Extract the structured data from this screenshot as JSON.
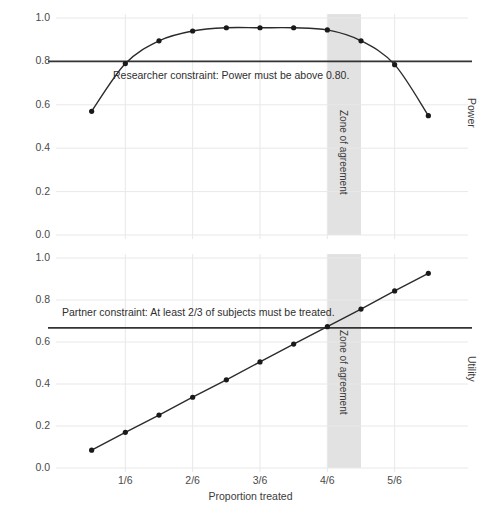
{
  "figure": {
    "width": 501,
    "height": 519,
    "background": "#ffffff",
    "grid_color": "#e8e8e8",
    "line_color": "#2b2b2b",
    "marker_color": "#1a1a1a",
    "band_color": "#e2e2e2"
  },
  "xaxis": {
    "label": "Proportion treated",
    "ticks": [
      "1/6",
      "2/6",
      "3/6",
      "4/6",
      "5/6"
    ],
    "tick_values": [
      0.16667,
      0.33333,
      0.5,
      0.66667,
      0.83333
    ],
    "range": [
      0.0,
      1.0
    ]
  },
  "panels": {
    "power": {
      "axis_title": "Power",
      "yticks": [
        "0.0",
        "0.2",
        "0.4",
        "0.6",
        "0.8",
        "1.0"
      ],
      "ytick_values": [
        0.0,
        0.2,
        0.4,
        0.6,
        0.8,
        1.0
      ],
      "ylim": [
        0.0,
        1.0
      ],
      "constraint_value": 0.8,
      "constraint_text": "Researcher constraint: Power must be above 0.80.",
      "zone_label": "Zone of agreement"
    },
    "utility": {
      "axis_title": "Utility",
      "yticks": [
        "0.0",
        "0.2",
        "0.4",
        "0.6",
        "0.8",
        "1.0"
      ],
      "ytick_values": [
        0.0,
        0.2,
        0.4,
        0.6,
        0.8,
        1.0
      ],
      "ylim": [
        0.0,
        1.0
      ],
      "constraint_value": 0.667,
      "constraint_text": "Partner constraint: At least 2/3 of subjects must be treated.",
      "zone_label": "Zone of agreement"
    }
  },
  "zone": {
    "x_start": 0.6667,
    "x_end": 0.75,
    "label": "Zone of agreement"
  },
  "chart_data": {
    "type": "line",
    "title": "",
    "xlabel": "Proportion treated",
    "xlim": [
      0.0,
      1.0
    ],
    "x_tick_labels": [
      "1/6",
      "2/6",
      "3/6",
      "4/6",
      "5/6"
    ],
    "x_tick_values": [
      0.16667,
      0.33333,
      0.5,
      0.66667,
      0.83333
    ],
    "grid": true,
    "legend_position": "none",
    "panels": [
      {
        "name": "Power",
        "ylabel": "Power",
        "ylim": [
          0.0,
          1.0
        ],
        "y_tick_values": [
          0.0,
          0.2,
          0.4,
          0.6,
          0.8,
          1.0
        ],
        "x": [
          0.0833,
          0.1667,
          0.25,
          0.3333,
          0.4167,
          0.5,
          0.5833,
          0.6667,
          0.75,
          0.8333,
          0.9167
        ],
        "values": [
          0.57,
          0.79,
          0.895,
          0.94,
          0.955,
          0.955,
          0.955,
          0.945,
          0.895,
          0.785,
          0.55
        ],
        "hline": {
          "value": 0.8,
          "label": "Researcher constraint: Power must be above 0.80."
        },
        "shaded_band": {
          "x_start": 0.6667,
          "x_end": 0.75,
          "label": "Zone of agreement"
        }
      },
      {
        "name": "Utility",
        "ylabel": "Utility",
        "ylim": [
          0.0,
          1.0
        ],
        "y_tick_values": [
          0.0,
          0.2,
          0.4,
          0.6,
          0.8,
          1.0
        ],
        "x": [
          0.0833,
          0.1667,
          0.25,
          0.3333,
          0.4167,
          0.5,
          0.5833,
          0.6667,
          0.75,
          0.8333,
          0.9167
        ],
        "values": [
          0.085,
          0.17,
          0.252,
          0.337,
          0.42,
          0.505,
          0.59,
          0.673,
          0.757,
          0.843,
          0.927
        ],
        "hline": {
          "value": 0.667,
          "label": "Partner constraint: At least 2/3 of subjects must be treated."
        },
        "shaded_band": {
          "x_start": 0.6667,
          "x_end": 0.75,
          "label": "Zone of agreement"
        }
      }
    ]
  }
}
